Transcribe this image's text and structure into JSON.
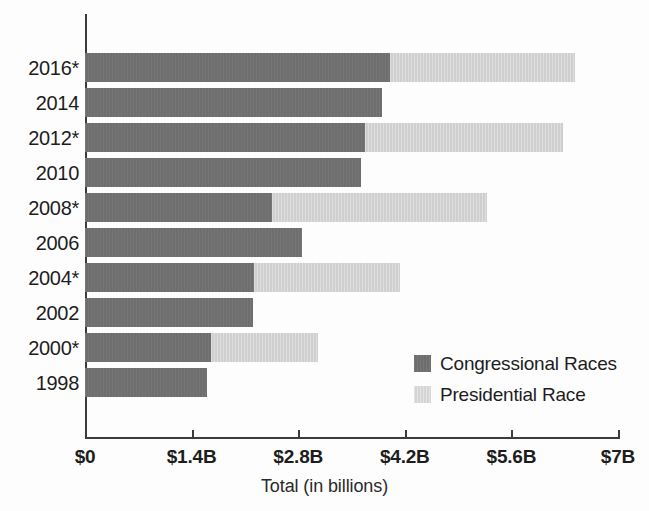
{
  "chart_data": {
    "type": "bar",
    "orientation": "horizontal",
    "stacked": true,
    "title": "",
    "xlabel": "Total (in billions)",
    "ylabel": "",
    "xlim": [
      0,
      7
    ],
    "xticks": [
      0,
      1.4,
      2.8,
      4.2,
      5.6,
      7
    ],
    "xtick_labels": [
      "$0",
      "$1.4B",
      "$2.8B",
      "$4.2B",
      "$5.6B",
      "$7B"
    ],
    "grid": false,
    "legend_position": "inside-lower-right",
    "categories": [
      "2016*",
      "2014",
      "2012*",
      "2010",
      "2008*",
      "2006",
      "2004*",
      "2002",
      "2000*",
      "1998"
    ],
    "series": [
      {
        "name": "Congressional Races",
        "color": "#6e6e6e",
        "values": [
          4.0,
          3.9,
          3.68,
          3.62,
          2.46,
          2.85,
          2.22,
          2.21,
          1.66,
          1.6
        ]
      },
      {
        "name": "Presidential Race",
        "color": "#cfcfcf",
        "values": [
          2.44,
          0,
          2.6,
          0,
          2.82,
          0,
          1.92,
          0,
          1.4,
          0
        ]
      }
    ],
    "totals": [
      6.44,
      3.9,
      6.28,
      3.62,
      5.28,
      2.85,
      4.14,
      2.21,
      3.06,
      1.6
    ]
  },
  "axis": {
    "x_title": "Total (in billions)"
  },
  "legend": {
    "items": [
      {
        "label": "Congressional Races",
        "swatch": "congress"
      },
      {
        "label": "Presidential Race",
        "swatch": "president"
      }
    ]
  }
}
